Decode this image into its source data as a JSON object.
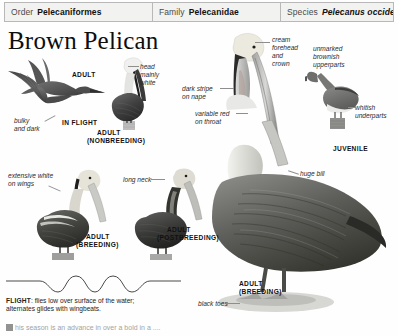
{
  "taxonomy": {
    "order_rank": "Order",
    "order_name": "Pelecaniformes",
    "family_rank": "Family",
    "family_name": "Pelecanidae",
    "species_rank": "Species",
    "species_name": "Pelecanus occidentalis"
  },
  "title": "Brown Pelican",
  "annotations": {
    "bulky_and_dark": "bulky\nand dark",
    "adult_in_flight_top": "ADULT",
    "in_flight": "IN FLIGHT",
    "head_mainly_white": "head\nmainly\nwhite",
    "adult_nonbreeding_line1": "ADULT",
    "adult_nonbreeding_line2": "(NONBREEDING)",
    "dark_stripe_on_nape": "dark stripe\non nape",
    "variable_red_on_throat": "variable red\non throat",
    "cream_forehead_and_crown": "cream\nforehead\nand\ncrown",
    "unmarked_brownish_upperparts": "unmarked\nbrownish\nupperparts",
    "whitish_underparts": "whitish\nunderparts",
    "juvenile": "JUVENILE",
    "extensive_white_on_wings": "extensive white\non wings",
    "long_neck": "long neck",
    "huge_bill": "huge bill",
    "adult_breeding_left_line1": "ADULT",
    "adult_breeding_left_line2": "(BREEDING)",
    "adult_postbreeding_line1": "ADULT",
    "adult_postbreeding_line2": "(POSTBREEDING)",
    "adult_breeding_main_line1": "ADULT",
    "adult_breeding_main_line2": "(BREEDING)",
    "black_toes": "black toes"
  },
  "flight": {
    "heading": "FLIGHT",
    "text": ": flies low over surface of the water;",
    "line2": "alternates glides with wingbeats."
  },
  "bottom_clipped": {
    "text": "his season is an advance in over a bold in a ...."
  },
  "colors": {
    "header_bg": "#f2f2f0",
    "header_border": "#b8b8b8",
    "page_bg": "#fefefe",
    "text": "#1a1a1a",
    "leader": "#8e8e8e"
  }
}
